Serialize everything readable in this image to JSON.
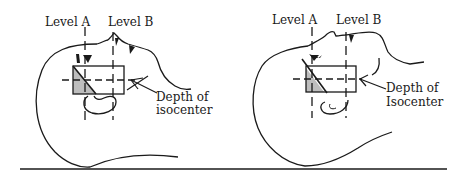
{
  "figure": {
    "panels": [
      {
        "id": "left",
        "level_a_label": "Level A",
        "level_b_label": "Level B",
        "depth_label_line1": "Depth of",
        "depth_label_line2": "isocenter"
      },
      {
        "id": "right",
        "level_a_label": "Level A",
        "level_b_label": "Level B",
        "depth_label_line1": "Depth of",
        "depth_label_line2": "Isocenter"
      }
    ],
    "colors": {
      "stroke": "#1a1a1a",
      "shaded_wedge": "#bdbdbd",
      "background": "#ffffff"
    }
  }
}
